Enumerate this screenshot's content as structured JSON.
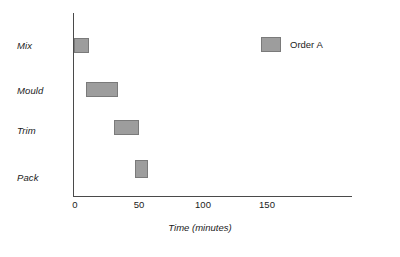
{
  "chart_data": {
    "type": "bar",
    "chart_subtype": "gantt",
    "title": "",
    "xlabel": "Time (minutes)",
    "ylabel": "",
    "xlim": [
      0,
      217
    ],
    "grid": false,
    "legend_position": "top-right",
    "categories": [
      "Mix",
      "Mould",
      "Trim",
      "Pack"
    ],
    "xticks": [
      0,
      50,
      100,
      150
    ],
    "xtick_labels": [
      "0",
      "50",
      "100",
      "150"
    ],
    "series": [
      {
        "name": "Order A",
        "color": "#9d9d9d",
        "tasks": [
          {
            "category": "Mix",
            "start": 0,
            "end": 12,
            "duration": 12
          },
          {
            "category": "Mould",
            "start": 9,
            "end": 34,
            "duration": 25
          },
          {
            "category": "Trim",
            "start": 31,
            "end": 51,
            "duration": 20
          },
          {
            "category": "Pack",
            "start": 48,
            "end": 58,
            "duration": 10
          }
        ]
      }
    ],
    "legend": [
      {
        "label": "Order A",
        "color": "#9d9d9d"
      }
    ]
  },
  "axis": {
    "x_title": "Time (minutes)",
    "tick_0": "0",
    "tick_1": "50",
    "tick_2": "100",
    "tick_3": "150"
  },
  "rows": [
    {
      "label": "Mix"
    },
    {
      "label": "Mould"
    },
    {
      "label": "Trim"
    },
    {
      "label": "Pack"
    }
  ],
  "legend": {
    "order_a_label": "Order A"
  },
  "colors": {
    "bar_fill": "#9d9d9d",
    "bar_stroke": "#7a7a7a",
    "axis": "#4a4a4a",
    "text": "#1b1b1b",
    "background": "#ffffff"
  }
}
